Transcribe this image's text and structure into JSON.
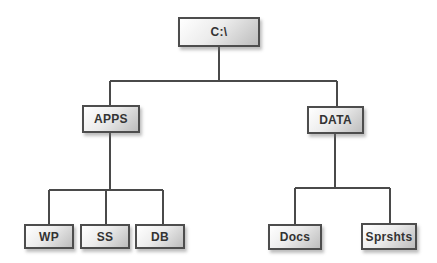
{
  "diagram": {
    "type": "tree",
    "colors": {
      "background": "#ffffff",
      "box_border": "#4d4d4d",
      "box_fill_light": "#ffffff",
      "box_fill_dark": "#bdbdbd",
      "line": "#4a4a4a",
      "text": "#333333"
    },
    "nodes": {
      "root": {
        "label": "C:\\"
      },
      "apps": {
        "label": "APPS"
      },
      "data": {
        "label": "DATA"
      },
      "wp": {
        "label": "WP"
      },
      "ss": {
        "label": "SS"
      },
      "db": {
        "label": "DB"
      },
      "docs": {
        "label": "Docs"
      },
      "sprshts": {
        "label": "Sprshts"
      }
    },
    "edges": [
      {
        "from": "root",
        "to": "apps"
      },
      {
        "from": "root",
        "to": "data"
      },
      {
        "from": "apps",
        "to": "wp"
      },
      {
        "from": "apps",
        "to": "ss"
      },
      {
        "from": "apps",
        "to": "db"
      },
      {
        "from": "data",
        "to": "docs"
      },
      {
        "from": "data",
        "to": "sprshts"
      }
    ]
  }
}
